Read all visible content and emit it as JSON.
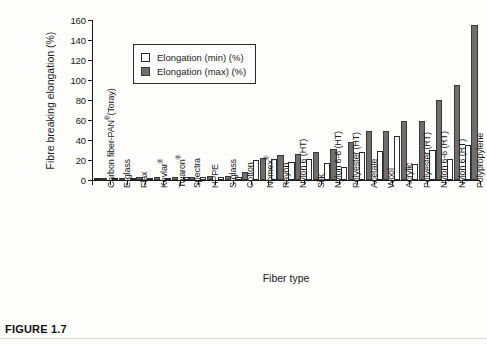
{
  "figure": {
    "caption": "FIGURE 1.7"
  },
  "chart_data": {
    "type": "bar",
    "title": "",
    "xlabel": "Fiber type",
    "ylabel": "Fibre breaking elongation (%)",
    "ylim": [
      0,
      160
    ],
    "yticks": [
      0,
      20,
      40,
      60,
      80,
      100,
      120,
      140,
      160
    ],
    "grid": false,
    "legend_position": "upper-left-inside",
    "categories": [
      "Carbon fiber-PAN®(Toray)",
      "E-glass",
      "Flax",
      "Kevlar®",
      "Twaron®",
      "Spectra",
      "HPPE",
      "S-glass",
      "Cotton",
      "Nomex®",
      "Rayon",
      "Nylon 6 (HT)",
      "Silk",
      "Nylon 6-6 (HT)",
      "Polyester (HT)",
      "Acetate",
      "Wool",
      "Acrylic",
      "Polyester (RT)",
      "Nylon 6-6 (RT)",
      "Nylon 6 (RT)",
      "Polypropylene"
    ],
    "series": [
      {
        "name": "Elongation (min) (%)",
        "color": "#ffffff",
        "values": [
          1.0,
          1.5,
          1.8,
          1.5,
          2.0,
          2.7,
          3.0,
          3.0,
          3.0,
          20.5,
          21.0,
          18.0,
          21.0,
          17.5,
          13.5,
          28.5,
          29.0,
          44.0,
          16.5,
          30.0,
          21.0,
          35.5
        ]
      },
      {
        "name": "Elongation (max) (%)",
        "color": "#6e6e6e",
        "values": [
          1.5,
          2.5,
          3.0,
          2.8,
          3.3,
          3.5,
          4.0,
          4.3,
          8.0,
          22.0,
          25.0,
          26.0,
          28.0,
          31.5,
          38.5,
          49.0,
          49.5,
          59.5,
          59.5,
          80.5,
          95.0,
          155.0
        ]
      }
    ]
  }
}
